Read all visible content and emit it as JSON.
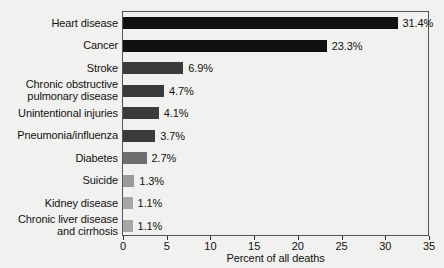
{
  "chart_data": {
    "type": "bar",
    "orientation": "horizontal",
    "title": "",
    "xlabel": "Percent of all deaths",
    "ylabel": "",
    "xlim": [
      0,
      35
    ],
    "xticks": [
      0,
      5,
      10,
      15,
      20,
      25,
      30,
      35
    ],
    "grid": false,
    "legend": false,
    "categories": [
      "Heart disease",
      "Cancer",
      "Stroke",
      "Chronic obstructive\npulmonary disease",
      "Unintentional injuries",
      "Pneumonia/influenza",
      "Diabetes",
      "Suicide",
      "Kidney disease",
      "Chronic liver disease\nand cirrhosis"
    ],
    "values": [
      31.4,
      23.3,
      6.9,
      4.7,
      4.1,
      3.7,
      2.7,
      1.3,
      1.1,
      1.1
    ],
    "value_labels": [
      "31.4%",
      "23.3%",
      "6.9%",
      "4.7%",
      "4.1%",
      "3.7%",
      "2.7%",
      "1.3%",
      "1.1%",
      "1.1%"
    ],
    "bar_colors": [
      "#111111",
      "#111111",
      "#3b3b3b",
      "#3b3b3b",
      "#3b3b3b",
      "#3b3b3b",
      "#6e6e6e",
      "#9a9a9a",
      "#a6a6a6",
      "#a6a6a6"
    ]
  },
  "colors": {
    "background": "#f1f1ef",
    "frame": "#555555",
    "text": "#111111"
  }
}
